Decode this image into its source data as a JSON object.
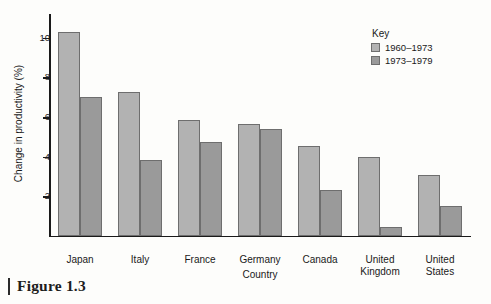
{
  "caption": {
    "label": "Figure 1.3"
  },
  "legend": {
    "title": "Key",
    "entries": [
      {
        "label": "1960–1973",
        "color": "#b2b2b2"
      },
      {
        "label": "1973–1979",
        "color": "#9a9a9a"
      }
    ]
  },
  "chart_data": {
    "type": "bar",
    "title": "",
    "xlabel": "Country",
    "ylabel": "Change in productivity (%)",
    "categories": [
      "Japan",
      "Italy",
      "France",
      "Germany",
      "Canada",
      "United Kingdom",
      "United States"
    ],
    "series": [
      {
        "name": "1960–1973",
        "color": "#b2b2b2",
        "values": [
          10.3,
          7.25,
          5.85,
          5.65,
          4.55,
          4.0,
          3.1
        ]
      },
      {
        "name": "1973–1979",
        "color": "#9a9a9a",
        "values": [
          7.0,
          3.85,
          4.75,
          5.4,
          2.3,
          0.45,
          1.5
        ]
      }
    ],
    "ylim": [
      0,
      11.2
    ],
    "yticks": [
      2,
      4,
      6,
      8,
      10
    ],
    "ytick_labels": [
      "2",
      "4",
      "6",
      "8",
      "10"
    ],
    "grid": false,
    "legend_position": "top-right"
  }
}
